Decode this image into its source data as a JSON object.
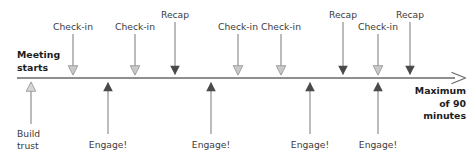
{
  "diagram": {
    "axis": {
      "label_start_line1": "Meeting",
      "label_start_line2": "starts",
      "label_end_line1": "Maximum",
      "label_end_line2": "of 90",
      "label_end_line3": "minutes",
      "color": "#6a6a6a",
      "x_start": 17,
      "x_end": 466,
      "y": 78
    },
    "colors": {
      "solid_arrow": "#4a4a4a",
      "light_arrow": "#b9b9b9",
      "text": "#3b3b3b",
      "bold_text": "#1d1d1d",
      "axis": "#6a6a6a",
      "stem": "#8a8a8a"
    },
    "top_markers": [
      {
        "label": "Check-in",
        "x": 73,
        "style": "light",
        "label_y": 21,
        "stem_top": 34
      },
      {
        "label": "Check-in",
        "x": 135,
        "style": "light",
        "label_y": 21,
        "stem_top": 34
      },
      {
        "label": "Recap",
        "x": 175,
        "style": "solid",
        "label_y": 9,
        "stem_top": 22
      },
      {
        "label": "Check-in",
        "x": 238,
        "style": "light",
        "label_y": 21,
        "stem_top": 34
      },
      {
        "label": "Check-in",
        "x": 281,
        "style": "light",
        "label_y": 21,
        "stem_top": 34
      },
      {
        "label": "Recap",
        "x": 343,
        "style": "solid",
        "label_y": 9,
        "stem_top": 22
      },
      {
        "label": "Check-in",
        "x": 378,
        "style": "light",
        "label_y": 21,
        "stem_top": 34
      },
      {
        "label": "Recap",
        "x": 410,
        "style": "solid",
        "label_y": 9,
        "stem_top": 22
      }
    ],
    "bottom_markers": [
      {
        "label": "Build\ntrust",
        "x": 31,
        "style": "light",
        "label_y": 128,
        "stem_bottom": 124
      },
      {
        "label": "Engage!",
        "x": 108,
        "style": "solid",
        "label_y": 139,
        "stem_bottom": 134
      },
      {
        "label": "Engage!",
        "x": 211,
        "style": "solid",
        "label_y": 139,
        "stem_bottom": 134
      },
      {
        "label": "Engage!",
        "x": 310,
        "style": "solid",
        "label_y": 139,
        "stem_bottom": 134
      },
      {
        "label": "Engage!",
        "x": 378,
        "style": "solid",
        "label_y": 139,
        "stem_bottom": 134
      }
    ]
  }
}
